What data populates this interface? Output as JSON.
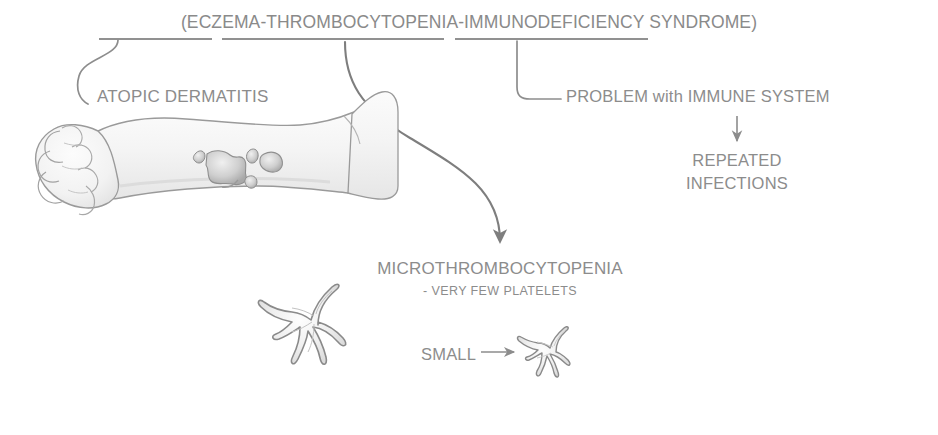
{
  "diagram": {
    "title": "(ECZEMA-THROMBOCYTOPENIA-IMMUNODEFICIENCY SYNDROME)",
    "ink_color": "#8c8c8c",
    "background": "#ffffff",
    "labels": {
      "atopic_dermatitis": "ATOPIC DERMATITIS",
      "immune_problem": "PROBLEM with IMMUNE SYSTEM",
      "repeated": "REPEATED",
      "infections": "INFECTIONS",
      "microthrombocytopenia": "MICROTHROMBOCYTOPENIA",
      "platelets_note": "- VERY FEW PLATELETS",
      "small": "SMALL"
    },
    "illustrations": {
      "arm": "arm-with-eczema-illustration",
      "hand": "closed-fist-illustration",
      "eczema_patches": "eczema-lesion-patches",
      "platelet_large": "large-spiky-platelet-illustration",
      "platelet_small": "small-spiky-platelet-illustration"
    },
    "connectors": {
      "eczema_underline": "underline-under-eczema",
      "thrombocytopenia_underline": "underline-under-thrombocytopenia",
      "immunodeficiency_underline": "underline-under-immunodeficiency",
      "eczema_leader": "leader-line-to-atopic-dermatitis",
      "thrombocytopenia_leader": "arrow-to-microthrombocytopenia",
      "immunodeficiency_leader": "leader-line-to-immune-problem",
      "infections_arrow": "down-arrow-to-repeated-infections",
      "small_arrow": "right-arrow-to-small-platelet"
    }
  }
}
